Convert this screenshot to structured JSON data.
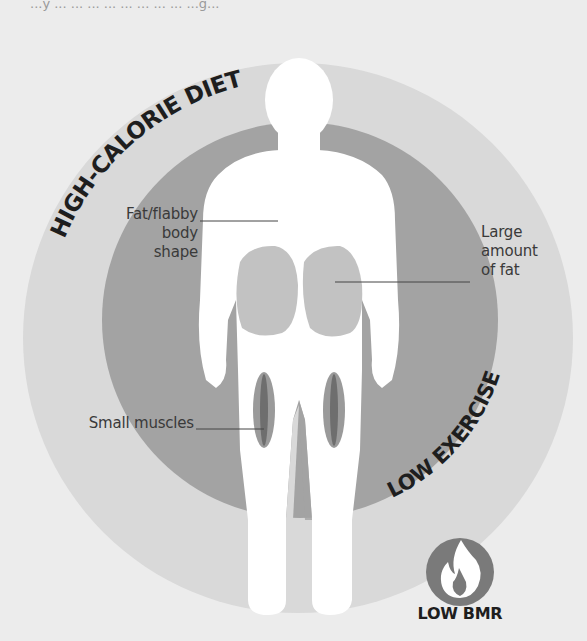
{
  "top_caption_fragment": "...y ... ... ... ... ... ... ... ... ...g...",
  "diagram": {
    "title_arcs": {
      "outer": "HIGH-CALORIE DIET",
      "inner": "LOW EXERCISE"
    },
    "callouts": {
      "body_shape": [
        "Fat/flabby",
        "body shape"
      ],
      "fat": [
        "Large",
        "amount",
        "of fat"
      ],
      "muscles": "Small muscles"
    },
    "badge": {
      "icon": "flame-icon",
      "label": "LOW BMR"
    },
    "colors": {
      "page_bg": "#ececec",
      "outer_circle": "#d9d9d9",
      "inner_ring": "#a3a3a3",
      "fat_blob": "#c2c2c2",
      "muscle_outer": "#9a9a9a",
      "muscle_inner": "#6e6e6e",
      "body": "#ffffff",
      "badge_bg": "#7a7a7a",
      "text": "#1e1e1e"
    }
  }
}
